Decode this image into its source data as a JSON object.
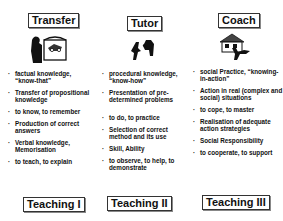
{
  "columns": [
    {
      "title": "Transfer",
      "icon": "teacher-at-board-icon",
      "items": [
        "factual knowledge, “know-that”",
        "Transfer of propositional knowledge",
        "to know, to remember",
        "Production of correct answers",
        "Verbal knowledge, Memorisation",
        "to teach, to explain"
      ],
      "footer": "Teaching I"
    },
    {
      "title": "Tutor",
      "icon": "tutor-and-learner-icon",
      "items": [
        "procedural knowledge, “know-how”",
        "Presentation of pre-determined problems",
        "to do, to practice",
        "Selection of correct method and its use",
        "Skill, Ability",
        "to observe, to help, to demonstrate"
      ],
      "footer": "Teaching II"
    },
    {
      "title": "Coach",
      "icon": "coach-with-house-icon",
      "items": [
        "social Practice, “knowing-in-action”",
        "Action in real (complex and social) situations",
        "to cope, to master",
        "Realisation of adequate action strategies",
        "Social Responsibility",
        "to cooperate, to support"
      ],
      "footer": "Teaching III"
    }
  ]
}
